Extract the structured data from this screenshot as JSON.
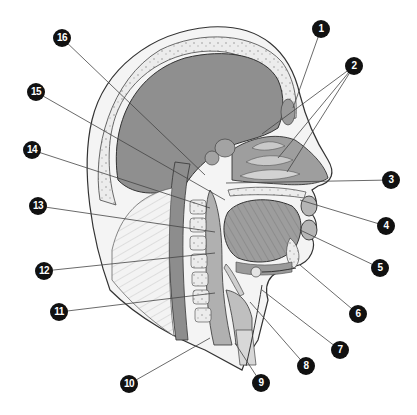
{
  "diagram": {
    "colors": {
      "background": "#ffffff",
      "brain": "#8f8f8f",
      "skull": "#e6e6e6",
      "soft_tissue": "#a8a8a8",
      "outline": "#333333",
      "label_fill": "#111111",
      "label_text": "#ffffff",
      "leader": "#444444"
    },
    "labels": [
      {
        "n": "1",
        "x": 321,
        "y": 29,
        "targets": [
          [
            293,
            108
          ]
        ]
      },
      {
        "n": "2",
        "x": 354,
        "y": 66,
        "targets": [
          [
            262,
            134
          ],
          [
            278,
            158
          ],
          [
            287,
            172
          ]
        ]
      },
      {
        "n": "3",
        "x": 391,
        "y": 180,
        "targets": [
          [
            226,
            183
          ]
        ]
      },
      {
        "n": "4",
        "x": 386,
        "y": 226,
        "targets": [
          [
            300,
            200
          ]
        ]
      },
      {
        "n": "5",
        "x": 380,
        "y": 268,
        "targets": [
          [
            300,
            230
          ]
        ]
      },
      {
        "n": "6",
        "x": 358,
        "y": 314,
        "targets": [
          [
            300,
            265
          ]
        ]
      },
      {
        "n": "7",
        "x": 340,
        "y": 350,
        "targets": [
          [
            262,
            290
          ]
        ]
      },
      {
        "n": "8",
        "x": 306,
        "y": 366,
        "targets": [
          [
            250,
            302
          ]
        ]
      },
      {
        "n": "9",
        "x": 261,
        "y": 383,
        "targets": [
          [
            235,
            343
          ]
        ]
      },
      {
        "n": "10",
        "x": 129,
        "y": 384,
        "targets": [
          [
            210,
            338
          ]
        ]
      },
      {
        "n": "11",
        "x": 59,
        "y": 312,
        "targets": [
          [
            215,
            293
          ]
        ]
      },
      {
        "n": "12",
        "x": 44,
        "y": 271,
        "targets": [
          [
            215,
            253
          ]
        ]
      },
      {
        "n": "13",
        "x": 38,
        "y": 206,
        "targets": [
          [
            215,
            232
          ]
        ]
      },
      {
        "n": "14",
        "x": 32,
        "y": 150,
        "targets": [
          [
            210,
            208
          ]
        ]
      },
      {
        "n": "15",
        "x": 36,
        "y": 92,
        "targets": [
          [
            225,
            200
          ]
        ]
      },
      {
        "n": "16",
        "x": 62,
        "y": 38,
        "targets": [
          [
            205,
            175
          ]
        ]
      }
    ]
  }
}
